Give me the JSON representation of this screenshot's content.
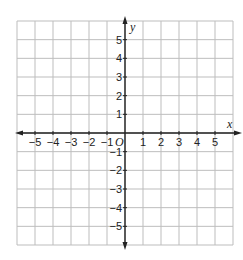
{
  "chart_data": {
    "type": "scatter",
    "title": "",
    "xlabel": "x",
    "ylabel": "y",
    "origin_label": "O",
    "xlim": [
      -6,
      6
    ],
    "ylim": [
      -6,
      6
    ],
    "grid": true,
    "x_ticks": [
      -5,
      -4,
      -3,
      -2,
      -1,
      1,
      2,
      3,
      4,
      5
    ],
    "y_ticks": [
      5,
      4,
      3,
      2,
      1,
      -1,
      -2,
      -3,
      -4,
      -5
    ],
    "x_tick_labels": [
      "−5",
      "−4",
      "−3",
      "−2",
      "−1",
      "1",
      "2",
      "3",
      "4",
      "5"
    ],
    "y_tick_labels": [
      "5",
      "4",
      "3",
      "2",
      "1",
      "−1",
      "−2",
      "−3",
      "−4",
      "−5"
    ],
    "points": [],
    "colors": {
      "grid": "#bdbdbd",
      "axis": "#222222",
      "background": "#ffffff"
    }
  }
}
